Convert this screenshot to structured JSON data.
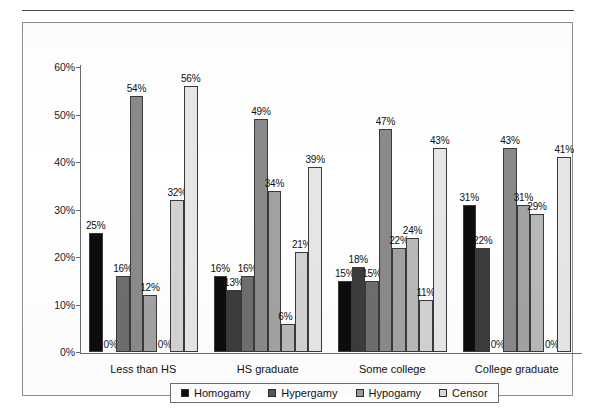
{
  "chart_data": {
    "type": "bar",
    "title": "",
    "xlabel": "",
    "ylabel": "",
    "ylim": [
      0,
      60
    ],
    "ytick_labels": [
      "0%",
      "10%",
      "20%",
      "30%",
      "40%",
      "50%",
      "60%"
    ],
    "ytick_values": [
      0,
      10,
      20,
      30,
      40,
      50,
      60
    ],
    "grid": false,
    "legend_position": "bottom",
    "categories": [
      "Less than HS",
      "HS graduate",
      "Some college",
      "College graduate"
    ],
    "series": [
      {
        "name": "Homogamy",
        "color": "#0d0d0d",
        "values": [
          25,
          16,
          15,
          31
        ],
        "labels": [
          "25%",
          "16%",
          "15%",
          "31%"
        ]
      },
      {
        "name": "Homogamy",
        "color": "#3c3c3c",
        "values": [
          0,
          13,
          18,
          22
        ],
        "labels": [
          "0%",
          "13%",
          "18%",
          "22%"
        ]
      },
      {
        "name": "Hypergamy",
        "color": "#6e6e6e",
        "values": [
          16,
          16,
          15,
          0
        ],
        "labels": [
          "16%",
          "16%",
          "15%",
          "0%"
        ]
      },
      {
        "name": "Hypergamy",
        "color": "#8a8a8a",
        "values": [
          54,
          49,
          47,
          43
        ],
        "labels": [
          "54%",
          "49%",
          "47%",
          "43%"
        ]
      },
      {
        "name": "Hypogamy",
        "color": "#a2a2a2",
        "values": [
          12,
          34,
          22,
          31
        ],
        "labels": [
          "12%",
          "34%",
          "22%",
          "31%"
        ]
      },
      {
        "name": "Hypogamy",
        "color": "#b8b8b8",
        "values": [
          0,
          6,
          24,
          29
        ],
        "labels": [
          "0%",
          "6%",
          "24%",
          "29%"
        ]
      },
      {
        "name": "Censor",
        "color": "#d2d2d2",
        "values": [
          32,
          21,
          11,
          0
        ],
        "labels": [
          "32%",
          "21%",
          "11%",
          "0%"
        ]
      },
      {
        "name": "Censor",
        "color": "#e6e6e6",
        "values": [
          56,
          39,
          43,
          41
        ],
        "labels": [
          "56%",
          "39%",
          "43%",
          "41%"
        ]
      }
    ]
  },
  "legend": {
    "items": [
      {
        "label": "Homogamy",
        "color": "#0d0d0d"
      },
      {
        "label": "Hypergamy",
        "color": "#565656"
      },
      {
        "label": "Hypogamy",
        "color": "#9a9a9a"
      },
      {
        "label": "Censor",
        "color": "#d8d8d8"
      }
    ]
  }
}
